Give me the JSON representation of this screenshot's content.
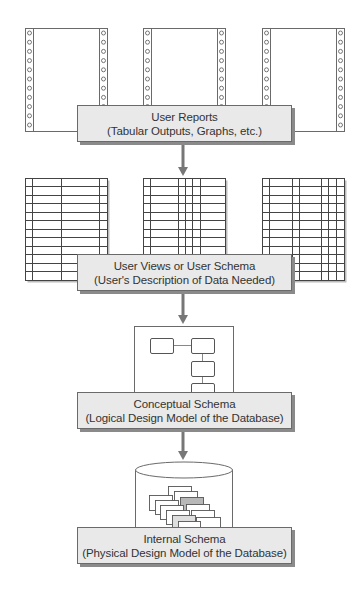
{
  "diagram": {
    "colors": {
      "line": "#6a6a6a",
      "arrow": "#777777",
      "box_fill": "#e9e9e9",
      "box_shadow": "#8a8a8a",
      "card_dark": "#b8b8b8",
      "card_light": "#dedede",
      "text": "#333333"
    },
    "levels": [
      {
        "id": "user-reports",
        "title": "User Reports",
        "subtitle": "(Tabular Outputs, Graphs, etc.)",
        "icon": "printout-pages-icon",
        "box": {
          "x": 77,
          "y": 105,
          "w": 215,
          "h": 37
        }
      },
      {
        "id": "user-views",
        "title": "User Views or User Schema",
        "subtitle": "(User's Description of Data Needed)",
        "icon": "spreadsheet-grids-icon",
        "box": {
          "x": 77,
          "y": 254,
          "w": 215,
          "h": 37
        }
      },
      {
        "id": "conceptual-schema",
        "title": "Conceptual Schema",
        "subtitle": "(Logical Design Model of the Database)",
        "icon": "entity-diagram-icon",
        "box": {
          "x": 77,
          "y": 392,
          "w": 215,
          "h": 37
        }
      },
      {
        "id": "internal-schema",
        "title": "Internal Schema",
        "subtitle": "(Physical Design Model of the Database)",
        "icon": "database-cylinder-icon",
        "box": {
          "x": 77,
          "y": 527,
          "w": 215,
          "h": 37
        }
      }
    ],
    "arrows": [
      {
        "from": "user-reports",
        "to": "user-views",
        "x": 183,
        "y1": 142,
        "y2": 176
      },
      {
        "from": "user-views",
        "to": "conceptual-schema",
        "x": 183,
        "y1": 291,
        "y2": 324
      },
      {
        "from": "conceptual-schema",
        "to": "internal-schema",
        "x": 183,
        "y1": 429,
        "y2": 460
      }
    ],
    "printouts": [
      {
        "x": 25,
        "y": 28,
        "w": 82,
        "h": 103
      },
      {
        "x": 143,
        "y": 28,
        "w": 82,
        "h": 103
      },
      {
        "x": 262,
        "y": 28,
        "w": 82,
        "h": 103
      }
    ],
    "spreadsheets": [
      {
        "x": 25,
        "y": 178,
        "w": 82,
        "h": 102,
        "cols": [
          32,
          61,
          99
        ]
      },
      {
        "x": 143,
        "y": 178,
        "w": 82,
        "h": 102,
        "cols": [
          150,
          178,
          185,
          192,
          200
        ]
      },
      {
        "x": 262,
        "y": 178,
        "w": 82,
        "h": 102,
        "cols": [
          269,
          292,
          299,
          321,
          328,
          336
        ]
      }
    ],
    "entity_diagram": {
      "frame": {
        "x": 134,
        "y": 326,
        "w": 99,
        "h": 72
      },
      "entities": [
        {
          "x": 150,
          "y": 338,
          "w": 23,
          "h": 15
        },
        {
          "x": 191,
          "y": 338,
          "w": 23,
          "h": 15
        },
        {
          "x": 191,
          "y": 361,
          "w": 23,
          "h": 15
        },
        {
          "x": 191,
          "y": 383,
          "w": 23,
          "h": 15
        }
      ]
    },
    "database": {
      "x": 135,
      "y": 462,
      "w": 97,
      "h": 66,
      "ellipse_ry": 8,
      "cards": [
        {
          "x": 168,
          "y": 486,
          "w": 23,
          "h": 14,
          "shade": "white"
        },
        {
          "x": 149,
          "y": 495,
          "w": 23,
          "h": 15,
          "shade": "white"
        },
        {
          "x": 174,
          "y": 491,
          "w": 23,
          "h": 14,
          "shade": "white"
        },
        {
          "x": 155,
          "y": 500,
          "w": 23,
          "h": 14,
          "shade": "white"
        },
        {
          "x": 180,
          "y": 497,
          "w": 23,
          "h": 14,
          "shade": "dark"
        },
        {
          "x": 160,
          "y": 505,
          "w": 23,
          "h": 14,
          "shade": "white"
        },
        {
          "x": 186,
          "y": 504,
          "w": 23,
          "h": 14,
          "shade": "white"
        },
        {
          "x": 166,
          "y": 510,
          "w": 23,
          "h": 14,
          "shade": "white"
        },
        {
          "x": 191,
          "y": 510,
          "w": 23,
          "h": 14,
          "shade": "white"
        },
        {
          "x": 172,
          "y": 515,
          "w": 23,
          "h": 13,
          "shade": "light"
        },
        {
          "x": 196,
          "y": 517,
          "w": 24,
          "h": 12,
          "shade": "white"
        },
        {
          "x": 178,
          "y": 521,
          "w": 22,
          "h": 8,
          "shade": "white"
        }
      ]
    }
  }
}
